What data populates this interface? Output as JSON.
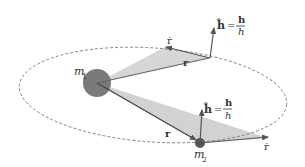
{
  "diagram": {
    "colors": {
      "orbit": "#777777",
      "swept_area": "#d4d4d4",
      "vector": "#555555",
      "m1": "#7a7a7a",
      "m2": "#555555",
      "text": "#333333"
    },
    "labels": {
      "m1": "m",
      "m1_sub": "1",
      "m2": "m",
      "m2_sub": "2",
      "h_hat": "ĥ",
      "equals": "=",
      "h_bold": "h",
      "h_italic": "h",
      "r_vector": "r",
      "r_dot": "ṙ"
    },
    "top_vectors": {
      "h_hat_label": "ĥ = h / h",
      "r_label": "r",
      "r_dot_label": "ṙ"
    },
    "bottom_vectors": {
      "h_hat_label": "ĥ = h / h",
      "r_label": "r",
      "r_dot_label": "ṙ"
    }
  }
}
